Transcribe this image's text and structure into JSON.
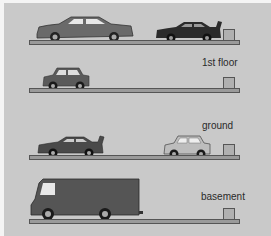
{
  "levels": [
    {
      "id": "top",
      "label": ""
    },
    {
      "id": "first",
      "label": "1st floor"
    },
    {
      "id": "ground",
      "label": "ground"
    },
    {
      "id": "basement",
      "label": "basement"
    }
  ],
  "colors": {
    "background": "#c9c9c9",
    "floor": "#9a9a9a",
    "outline": "#555555",
    "vehicle_dark": "#5a5a5a",
    "vehicle_black": "#2b2b2b",
    "vehicle_light": "#bdbdbd"
  }
}
